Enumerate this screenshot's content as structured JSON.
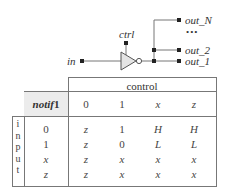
{
  "diagram": {
    "input_label": "in",
    "control_label": "ctrl",
    "gate": "notif1",
    "outputs": [
      "out_N",
      "out_2",
      "out_1"
    ],
    "ellipsis": "•••"
  },
  "table": {
    "gate_name_italic": "notif",
    "gate_name_suffix": "1",
    "control_header": "control",
    "input_header_letters": [
      "i",
      "n",
      "p",
      "u",
      "t"
    ],
    "columns": [
      "0",
      "1",
      "x",
      "z"
    ],
    "rows": [
      {
        "input": "0",
        "values": [
          "z",
          "1",
          "H",
          "H"
        ]
      },
      {
        "input": "1",
        "values": [
          "z",
          "0",
          "L",
          "L"
        ]
      },
      {
        "input": "x",
        "values": [
          "z",
          "x",
          "x",
          "x"
        ]
      },
      {
        "input": "z",
        "values": [
          "z",
          "x",
          "x",
          "x"
        ]
      }
    ]
  }
}
